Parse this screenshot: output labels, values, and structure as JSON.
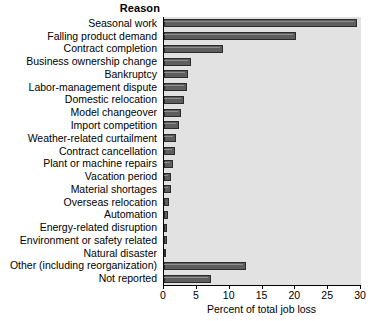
{
  "header": {
    "column_title": "Reason"
  },
  "axis": {
    "title": "Percent of total job loss",
    "ticks": [
      0,
      5,
      10,
      15,
      20,
      25,
      30
    ],
    "tick_labels": [
      "0",
      "5",
      "10",
      "15",
      "20",
      "25",
      "30"
    ]
  },
  "colors": {
    "bar_fill": "#5e5e5e",
    "bar_edge": "#2b2b2b",
    "plot_background": "#e2e2e2",
    "page_background": "#ffffff",
    "text": "#000000"
  },
  "chart_data": {
    "type": "bar",
    "orientation": "horizontal",
    "title": "",
    "xlabel": "Percent of total job loss",
    "ylabel": "Reason",
    "xlim": [
      0,
      30
    ],
    "grid": false,
    "legend": null,
    "categories": [
      "Seasonal work",
      "Falling product demand",
      "Contract completion",
      "Business ownership change",
      "Bankruptcy",
      "Labor-management dispute",
      "Domestic relocation",
      "Model changeover",
      "Import competition",
      "Weather-related curtailment",
      "Contract cancellation",
      "Plant or machine repairs",
      "Vacation period",
      "Material shortages",
      "Overseas relocation",
      "Automation",
      "Energy-related disruption",
      "Environment or safety related",
      "Natural disaster",
      "Other (including reorganization)",
      "Not reported"
    ],
    "values": [
      29.4,
      20.1,
      9.0,
      4.1,
      3.6,
      3.5,
      3.1,
      2.6,
      2.3,
      1.9,
      1.6,
      1.3,
      1.1,
      1.0,
      0.8,
      0.6,
      0.5,
      0.4,
      0.3,
      12.5,
      7.2
    ]
  }
}
